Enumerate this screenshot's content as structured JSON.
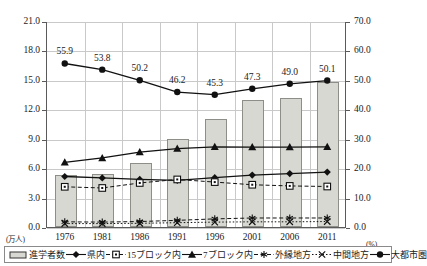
{
  "chart_data": {
    "type": "bar",
    "title": "",
    "categories": [
      "1976",
      "1981",
      "1986",
      "1991",
      "1996",
      "2001",
      "2006",
      "2011"
    ],
    "xlabel": "",
    "ylabel": "",
    "y_left": {
      "unit": "(万人)",
      "ticks": [
        "0.0",
        "3.0",
        "6.0",
        "9.0",
        "12.0",
        "15.0",
        "18.0",
        "21.0"
      ],
      "tick_values": [
        0,
        3,
        6,
        9,
        12,
        15,
        18,
        21
      ],
      "ylim": [
        0,
        21
      ]
    },
    "y_right": {
      "unit": "(%)",
      "ticks": [
        "0.0",
        "10.0",
        "20.0",
        "30.0",
        "40.0",
        "50.0",
        "60.0",
        "70.0"
      ],
      "tick_values": [
        0,
        10,
        20,
        30,
        40,
        50,
        60,
        70
      ],
      "ylim": [
        0,
        70
      ]
    },
    "grid": true,
    "legend_position": "bottom",
    "series": [
      {
        "name": "進学者数",
        "legend_label": "進学者数",
        "type": "bar",
        "axis": "left",
        "unit": "万人",
        "marker": "bar",
        "values": [
          5.3,
          5.4,
          6.5,
          9.0,
          11.0,
          12.9,
          13.2,
          14.8
        ]
      },
      {
        "name": "県内",
        "legend_label": "県内",
        "type": "line",
        "axis": "right",
        "unit": "%",
        "marker": "diamond",
        "line": "solid",
        "values": [
          17.5,
          17.0,
          16.5,
          16.2,
          17.1,
          18.0,
          18.5,
          19.0
        ]
      },
      {
        "name": "15ブロック内",
        "legend_label": "15ブロック内",
        "type": "line",
        "axis": "right",
        "unit": "%",
        "marker": "square",
        "line": "dashed",
        "values": [
          14.0,
          13.6,
          15.3,
          16.5,
          15.6,
          14.7,
          14.3,
          14.1
        ]
      },
      {
        "name": "7ブロック内",
        "legend_label": "7ブロック内",
        "type": "line",
        "axis": "right",
        "unit": "%",
        "marker": "triangle",
        "line": "solid",
        "values": [
          22.3,
          23.8,
          25.8,
          27.0,
          27.6,
          27.5,
          27.5,
          27.6
        ]
      },
      {
        "name": "外縁地方",
        "legend_label": "外縁地方",
        "type": "line",
        "axis": "right",
        "unit": "%",
        "marker": "asterisk",
        "line": "dashed",
        "values": [
          2.1,
          2.0,
          2.2,
          2.6,
          3.1,
          3.4,
          3.4,
          3.4
        ]
      },
      {
        "name": "中間地方",
        "legend_label": "中間地方",
        "type": "line",
        "axis": "right",
        "unit": "%",
        "marker": "cross",
        "line": "dotted",
        "values": [
          1.5,
          1.5,
          1.6,
          1.8,
          2.0,
          2.1,
          2.1,
          2.2
        ]
      },
      {
        "name": "大都市圏",
        "legend_label": "大都市圏",
        "type": "line",
        "axis": "right",
        "unit": "%",
        "marker": "circle",
        "line": "solid",
        "labels": [
          "55.9",
          "53.8",
          "50.2",
          "46.2",
          "45.3",
          "47.3",
          "49.0",
          "50.1"
        ],
        "values": [
          55.9,
          53.8,
          50.2,
          46.2,
          45.3,
          47.3,
          49.0,
          50.1
        ]
      }
    ],
    "data_labels": {
      "series": "大都市圏",
      "values": [
        "55.9",
        "53.8",
        "50.2",
        "46.2",
        "45.3",
        "47.3",
        "49.0",
        "50.1"
      ]
    }
  }
}
